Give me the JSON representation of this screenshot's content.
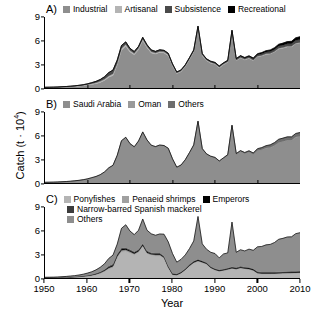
{
  "chart_data": {
    "type": "area",
    "title": "",
    "xlabel": "Year",
    "ylabel": "Catch (t · 10⁴)",
    "xlim": [
      1950,
      2010
    ],
    "ylim": [
      0,
      9
    ],
    "yticks": [
      0,
      3,
      6,
      9
    ],
    "xticks": [
      1950,
      1960,
      1970,
      1980,
      1990,
      2000,
      2010
    ],
    "grid": false,
    "stacked": true,
    "legend_position": "top-inside",
    "x": [
      1950,
      1951,
      1952,
      1953,
      1954,
      1955,
      1956,
      1957,
      1958,
      1959,
      1960,
      1961,
      1962,
      1963,
      1964,
      1965,
      1966,
      1967,
      1968,
      1969,
      1970,
      1971,
      1972,
      1973,
      1974,
      1975,
      1976,
      1977,
      1978,
      1979,
      1980,
      1981,
      1982,
      1983,
      1984,
      1985,
      1986,
      1987,
      1988,
      1989,
      1990,
      1991,
      1992,
      1993,
      1994,
      1995,
      1996,
      1997,
      1998,
      1999,
      2000,
      2001,
      2002,
      2003,
      2004,
      2005,
      2006,
      2007,
      2008,
      2009,
      2010
    ],
    "panels": [
      {
        "id": "A)",
        "legend": [
          {
            "label": "Industrial",
            "color": "#8e8e8e"
          },
          {
            "label": "Artisanal",
            "color": "#b4b4b4"
          },
          {
            "label": "Subsistence",
            "color": "#4a4a4a"
          },
          {
            "label": "Recreational",
            "color": "#000000"
          }
        ],
        "series": [
          {
            "name": "Industrial",
            "color": "#8e8e8e",
            "values": [
              0.05,
              0.06,
              0.07,
              0.08,
              0.1,
              0.12,
              0.15,
              0.18,
              0.22,
              0.28,
              0.35,
              0.45,
              0.55,
              0.7,
              0.95,
              1.35,
              1.6,
              2.9,
              4.8,
              5.3,
              4.55,
              4.2,
              4.85,
              6.0,
              5.1,
              4.45,
              4.3,
              4.5,
              4.45,
              4.1,
              2.8,
              1.8,
              2.05,
              2.7,
              3.6,
              4.55,
              7.55,
              4.1,
              3.45,
              3.15,
              3.0,
              2.55,
              2.95,
              3.25,
              7.05,
              3.45,
              3.8,
              3.55,
              3.75,
              3.45,
              3.95,
              4.05,
              4.25,
              4.3,
              4.55,
              4.95,
              5.05,
              5.2,
              5.2,
              5.6,
              5.7
            ]
          },
          {
            "name": "Artisanal",
            "color": "#b4b4b4",
            "values": [
              0.02,
              0.02,
              0.02,
              0.03,
              0.03,
              0.04,
              0.04,
              0.05,
              0.06,
              0.07,
              0.08,
              0.1,
              0.12,
              0.14,
              0.16,
              0.18,
              0.2,
              0.22,
              0.22,
              0.22,
              0.2,
              0.18,
              0.18,
              0.18,
              0.16,
              0.15,
              0.14,
              0.14,
              0.13,
              0.12,
              0.1,
              0.09,
              0.09,
              0.1,
              0.1,
              0.11,
              0.12,
              0.1,
              0.09,
              0.09,
              0.08,
              0.08,
              0.08,
              0.08,
              0.09,
              0.08,
              0.08,
              0.08,
              0.08,
              0.08,
              0.08,
              0.08,
              0.08,
              0.08,
              0.08,
              0.08,
              0.08,
              0.08,
              0.08,
              0.08,
              0.08
            ]
          },
          {
            "name": "Subsistence",
            "color": "#4a4a4a",
            "values": [
              0.02,
              0.02,
              0.02,
              0.02,
              0.03,
              0.03,
              0.04,
              0.05,
              0.06,
              0.07,
              0.09,
              0.12,
              0.16,
              0.22,
              0.3,
              0.4,
              0.45,
              0.4,
              0.35,
              0.3,
              0.25,
              0.22,
              0.22,
              0.22,
              0.2,
              0.2,
              0.18,
              0.18,
              0.17,
              0.16,
              0.14,
              0.12,
              0.12,
              0.12,
              0.13,
              0.14,
              0.15,
              0.13,
              0.12,
              0.12,
              0.12,
              0.12,
              0.12,
              0.13,
              0.14,
              0.14,
              0.15,
              0.15,
              0.16,
              0.16,
              0.18,
              0.2,
              0.22,
              0.24,
              0.26,
              0.28,
              0.3,
              0.32,
              0.34,
              0.36,
              0.38
            ]
          },
          {
            "name": "Recreational",
            "color": "#000000",
            "values": [
              0.0,
              0.0,
              0.0,
              0.0,
              0.0,
              0.0,
              0.0,
              0.0,
              0.0,
              0.0,
              0.01,
              0.01,
              0.01,
              0.02,
              0.02,
              0.03,
              0.03,
              0.03,
              0.03,
              0.03,
              0.03,
              0.03,
              0.03,
              0.03,
              0.03,
              0.03,
              0.03,
              0.03,
              0.03,
              0.03,
              0.03,
              0.03,
              0.03,
              0.03,
              0.04,
              0.04,
              0.04,
              0.04,
              0.04,
              0.04,
              0.05,
              0.05,
              0.05,
              0.06,
              0.06,
              0.07,
              0.08,
              0.09,
              0.1,
              0.12,
              0.14,
              0.16,
              0.18,
              0.2,
              0.22,
              0.24,
              0.26,
              0.28,
              0.3,
              0.32,
              0.34
            ]
          }
        ]
      },
      {
        "id": "B)",
        "legend": [
          {
            "label": "Saudi Arabia",
            "color": "#8e8e8e"
          },
          {
            "label": "Oman",
            "color": "#9a9a9a"
          },
          {
            "label": "Others",
            "color": "#6e6e6e"
          }
        ],
        "series": [
          {
            "name": "Saudi Arabia",
            "color": "#8e8e8e",
            "values": [
              0.07,
              0.08,
              0.09,
              0.11,
              0.13,
              0.16,
              0.2,
              0.25,
              0.31,
              0.39,
              0.48,
              0.62,
              0.78,
              1.0,
              1.35,
              1.85,
              2.2,
              3.45,
              5.3,
              5.75,
              4.9,
              4.5,
              5.2,
              6.4,
              5.4,
              4.7,
              4.55,
              4.75,
              4.7,
              4.35,
              3.0,
              1.95,
              2.22,
              2.9,
              3.8,
              4.75,
              7.75,
              4.3,
              3.62,
              3.32,
              3.16,
              2.7,
              3.12,
              3.45,
              7.25,
              3.62,
              3.98,
              3.72,
              3.92,
              3.62,
              4.12,
              4.22,
              4.42,
              4.48,
              4.72,
              5.12,
              5.22,
              5.38,
              5.38,
              5.78,
              5.88
            ]
          },
          {
            "name": "Oman",
            "color": "#9a9a9a",
            "values": [
              0.0,
              0.0,
              0.0,
              0.0,
              0.0,
              0.0,
              0.0,
              0.0,
              0.0,
              0.0,
              0.0,
              0.0,
              0.0,
              0.0,
              0.0,
              0.0,
              0.0,
              0.0,
              0.0,
              0.0,
              0.0,
              0.0,
              0.0,
              0.0,
              0.0,
              0.0,
              0.0,
              0.0,
              0.0,
              0.0,
              0.0,
              0.0,
              0.0,
              0.0,
              0.0,
              0.0,
              0.0,
              0.0,
              0.0,
              0.0,
              0.0,
              0.0,
              0.0,
              0.0,
              0.0,
              0.0,
              0.0,
              0.0,
              0.0,
              0.0,
              0.01,
              0.01,
              0.01,
              0.02,
              0.02,
              0.02,
              0.03,
              0.03,
              0.03,
              0.04,
              0.04
            ]
          },
          {
            "name": "Others",
            "color": "#6e6e6e",
            "values": [
              0.02,
              0.02,
              0.02,
              0.02,
              0.03,
              0.03,
              0.03,
              0.03,
              0.03,
              0.03,
              0.05,
              0.06,
              0.05,
              0.06,
              0.06,
              0.08,
              0.05,
              0.07,
              0.07,
              0.05,
              0.1,
              0.1,
              0.13,
              0.08,
              0.06,
              0.1,
              0.07,
              0.07,
              0.05,
              0.06,
              0.07,
              0.06,
              0.06,
              0.05,
              0.07,
              0.09,
              0.11,
              0.07,
              0.08,
              0.08,
              0.09,
              0.1,
              0.08,
              0.15,
              0.09,
              0.12,
              0.13,
              0.15,
              0.17,
              0.19,
              0.22,
              0.26,
              0.3,
              0.34,
              0.38,
              0.41,
              0.44,
              0.44,
              0.44,
              0.46,
              0.48
            ]
          }
        ]
      },
      {
        "id": "C)",
        "legend": [
          {
            "label": "Ponyfishes",
            "color": "#b4b4b4"
          },
          {
            "label": "Penaeid shrimps",
            "color": "#a0a0a0"
          },
          {
            "label": "Emperors",
            "color": "#000000"
          },
          {
            "label": "Narrow-barred Spanish mackerel",
            "color": "#3c3c3c"
          },
          {
            "label": "Others",
            "color": "#8e8e8e"
          }
        ],
        "series": [
          {
            "name": "Ponyfishes",
            "color": "#b4b4b4",
            "values": [
              0.02,
              0.03,
              0.03,
              0.04,
              0.05,
              0.06,
              0.08,
              0.1,
              0.13,
              0.17,
              0.22,
              0.3,
              0.4,
              0.55,
              0.78,
              1.1,
              1.3,
              2.55,
              3.3,
              3.35,
              3.15,
              2.9,
              3.2,
              3.95,
              3.05,
              2.85,
              2.8,
              2.8,
              2.45,
              1.25,
              0.35,
              0.3,
              0.55,
              0.95,
              1.45,
              1.85,
              2.05,
              1.9,
              1.7,
              1.2,
              0.95,
              0.8,
              0.9,
              1.0,
              1.15,
              1.05,
              1.2,
              1.1,
              1.05,
              0.9,
              0.55,
              0.5,
              0.5,
              0.5,
              0.5,
              0.52,
              0.54,
              0.56,
              0.58,
              0.6,
              0.62
            ]
          },
          {
            "name": "Penaeid shrimps",
            "color": "#a0a0a0",
            "values": [
              0.01,
              0.01,
              0.01,
              0.01,
              0.02,
              0.02,
              0.02,
              0.03,
              0.03,
              0.04,
              0.05,
              0.06,
              0.08,
              0.1,
              0.13,
              0.18,
              0.2,
              0.22,
              0.22,
              0.22,
              0.2,
              0.18,
              0.18,
              0.18,
              0.16,
              0.15,
              0.15,
              0.15,
              0.14,
              0.12,
              0.1,
              0.09,
              0.09,
              0.1,
              0.11,
              0.12,
              0.13,
              0.11,
              0.1,
              0.1,
              0.09,
              0.09,
              0.09,
              0.1,
              0.1,
              0.1,
              0.1,
              0.1,
              0.1,
              0.09,
              0.08,
              0.08,
              0.08,
              0.08,
              0.08,
              0.08,
              0.08,
              0.08,
              0.08,
              0.08,
              0.08
            ]
          },
          {
            "name": "Emperors",
            "color": "#000000",
            "values": [
              0.01,
              0.01,
              0.01,
              0.01,
              0.01,
              0.02,
              0.02,
              0.02,
              0.03,
              0.03,
              0.04,
              0.05,
              0.06,
              0.08,
              0.1,
              0.13,
              0.15,
              0.16,
              0.16,
              0.16,
              0.15,
              0.14,
              0.14,
              0.14,
              0.13,
              0.12,
              0.12,
              0.12,
              0.11,
              0.1,
              0.09,
              0.08,
              0.08,
              0.09,
              0.1,
              0.11,
              0.12,
              0.1,
              0.1,
              0.1,
              0.09,
              0.09,
              0.09,
              0.1,
              0.1,
              0.1,
              0.11,
              0.11,
              0.11,
              0.11,
              0.1,
              0.1,
              0.1,
              0.1,
              0.1,
              0.1,
              0.1,
              0.1,
              0.1,
              0.1,
              0.1
            ]
          },
          {
            "name": "Narrow-barred Spanish mackerel",
            "color": "#3c3c3c",
            "values": [
              0.01,
              0.01,
              0.01,
              0.01,
              0.01,
              0.01,
              0.02,
              0.02,
              0.02,
              0.03,
              0.03,
              0.04,
              0.05,
              0.06,
              0.08,
              0.1,
              0.11,
              0.12,
              0.12,
              0.12,
              0.11,
              0.1,
              0.1,
              0.1,
              0.1,
              0.09,
              0.09,
              0.09,
              0.08,
              0.08,
              0.07,
              0.06,
              0.06,
              0.07,
              0.08,
              0.08,
              0.09,
              0.08,
              0.07,
              0.07,
              0.07,
              0.07,
              0.07,
              0.08,
              0.08,
              0.08,
              0.08,
              0.08,
              0.08,
              0.08,
              0.08,
              0.08,
              0.08,
              0.08,
              0.08,
              0.08,
              0.08,
              0.08,
              0.08,
              0.08,
              0.08
            ]
          },
          {
            "name": "Others",
            "color": "#8e8e8e",
            "values": [
              0.04,
              0.04,
              0.05,
              0.06,
              0.07,
              0.09,
              0.11,
              0.13,
              0.17,
              0.21,
              0.28,
              0.34,
              0.44,
              0.57,
              0.71,
              0.97,
              1.14,
              1.25,
              2.5,
              2.9,
              2.34,
              2.18,
              2.43,
              3.11,
              2.62,
              2.39,
              2.26,
              2.42,
              2.77,
              3.03,
              2.49,
              1.48,
              1.58,
              1.71,
              1.99,
              2.54,
              5.41,
              2.14,
              1.68,
              1.79,
              1.9,
              1.5,
              1.9,
              1.9,
              5.66,
              1.93,
              2.09,
              2.04,
              2.32,
              2.33,
              3.14,
              3.24,
              3.44,
              3.5,
              3.74,
              4.13,
              4.23,
              4.38,
              4.38,
              4.76,
              4.86
            ]
          }
        ]
      }
    ]
  }
}
